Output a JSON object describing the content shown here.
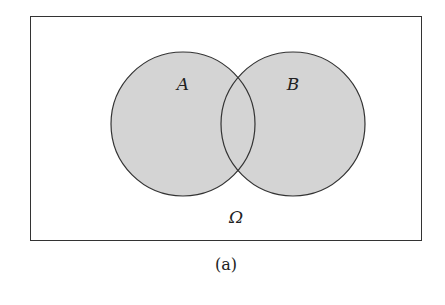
{
  "diagram": {
    "type": "venn",
    "universe": {
      "label": "Ω",
      "x": 30,
      "y": 16,
      "width": 391,
      "height": 224
    },
    "sets": [
      {
        "label": "A",
        "cx": 183,
        "cy": 124,
        "r": 72
      },
      {
        "label": "B",
        "cx": 293,
        "cy": 124,
        "r": 72
      }
    ],
    "fill_color": "#d4d4d4",
    "stroke_color": "#333333",
    "caption": "(a)"
  }
}
